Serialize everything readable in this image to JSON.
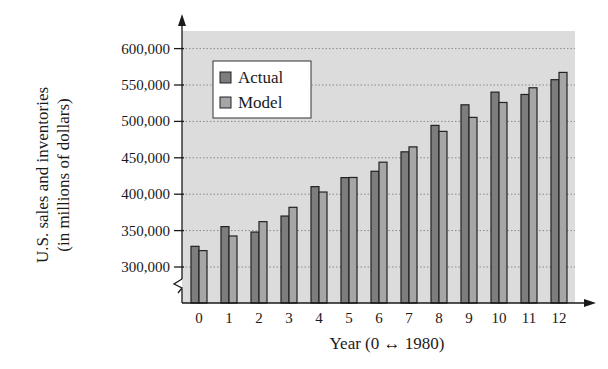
{
  "chart_data": {
    "type": "bar",
    "title": "",
    "xlabel": "Year (0 ↔ 1980)",
    "ylabel_line1": "U.S. sales and inventories",
    "ylabel_line2": "(in millions of dollars)",
    "ylim": [
      250000,
      620000
    ],
    "y_ticks": [
      300000,
      350000,
      400000,
      450000,
      500000,
      550000,
      600000
    ],
    "y_tick_labels": [
      "300,000",
      "350,000",
      "400,000",
      "450,000",
      "500,000",
      "550,000",
      "600,000"
    ],
    "y_axis_break": true,
    "grid": "horizontal dotted",
    "legend_position": "upper left",
    "categories": [
      "0",
      "1",
      "2",
      "3",
      "4",
      "5",
      "6",
      "7",
      "8",
      "9",
      "10",
      "11",
      "12"
    ],
    "series": [
      {
        "name": "Actual",
        "color": "#7d7d7d",
        "values": [
          328400,
          355500,
          348000,
          370000,
          410400,
          422800,
          431500,
          458200,
          494500,
          522800,
          540200,
          537000,
          557300
        ]
      },
      {
        "name": "Model",
        "color": "#a6a6a6",
        "values": [
          322500,
          342600,
          362300,
          382000,
          403000,
          423000,
          444000,
          465000,
          486300,
          505500,
          526000,
          546200,
          567300
        ]
      }
    ]
  },
  "colors": {
    "plot_background": "#dcdcdc",
    "axis": "#1a1a1a",
    "grid": "#8a8a8a",
    "legend_background": "#ffffff"
  }
}
